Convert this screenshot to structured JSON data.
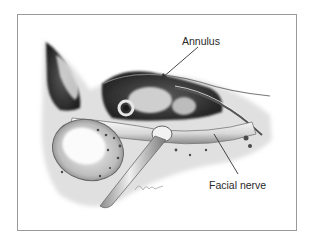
{
  "figure": {
    "type": "anatomical-illustration",
    "frame_color": "#9a9a9a",
    "labels": [
      {
        "id": "annulus",
        "text": "Annulus"
      },
      {
        "id": "facial_nerve",
        "text": "Facial nerve"
      }
    ],
    "signature": "Cond '93"
  }
}
